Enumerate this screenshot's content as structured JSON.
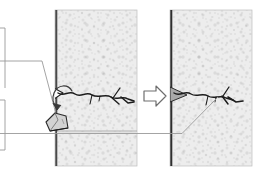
{
  "figure": {
    "background_color": "#ffffff",
    "canvas": {
      "width": 262,
      "height": 180
    }
  },
  "palette": {
    "wall_fill": "#ededed",
    "wall_speckle": "#c9c9c9",
    "wall_edge_dark": "#4a4a4a",
    "wall_border": "#b8b8b8",
    "crack_ink": "#1c1c1c",
    "leader_line": "#9a9a9a",
    "arrow_outline": "#6e6e6e",
    "tool_fill": "#d2d2d2",
    "patch_fill": "#a9a9a9"
  },
  "panels": [
    {
      "id": "panel-before",
      "label": "Cracked wall, before repair",
      "x": 55,
      "y": 10,
      "width": 82,
      "height": 156,
      "edge_side": "left",
      "mortar_joint_y": 131,
      "crack_state": "open",
      "has_tool": true
    },
    {
      "id": "panel-after",
      "label": "Repaired wall, after filling",
      "x": 170,
      "y": 10,
      "width": 82,
      "height": 156,
      "edge_side": "left",
      "mortar_joint_y": 131,
      "crack_state": "filled",
      "has_tool": false
    }
  ],
  "transition_arrow": {
    "name": "process-arrow",
    "direction": "right",
    "x": 143,
    "y": 86,
    "width": 24,
    "height": 20,
    "style": "hollow-outline"
  },
  "tool": {
    "name": "chisel-wedge",
    "label": "Hand chisel / wedge",
    "x": 46,
    "y": 113,
    "width": 22,
    "height": 22
  },
  "callouts": [
    {
      "id": "callout-tool",
      "name": "leader-line-tool",
      "target": "chisel-wedge",
      "style": "straight-leader"
    },
    {
      "id": "callout-crack-open",
      "name": "curved-arrow-to-tool",
      "target": "open-crack-mouth",
      "style": "curved-arrow"
    },
    {
      "id": "callout-patch",
      "name": "leader-line-patch",
      "target": "filled-crack",
      "style": "straight-leader"
    }
  ],
  "crack_geometry": {
    "before": {
      "main_path": "M56,92 L64,95 L72,93 L82,96 L92,94 L104,97 L116,95 L126,99",
      "branches": [
        "M92,94 L90,103",
        "M104,97 L113,104",
        "M116,95 L121,88",
        "M126,99 L133,101"
      ]
    },
    "after": {
      "main_path": "M171,92 L180,95 L189,93 L199,96 L210,95 L221,98 L231,96 L241,100",
      "branches": [
        "M210,95 L214,104",
        "M221,98 L228,105",
        "M221,98 L226,88",
        "M241,100 L248,102"
      ],
      "patch_fill_path": "M171,87 L186,95 L171,101 Z"
    }
  }
}
